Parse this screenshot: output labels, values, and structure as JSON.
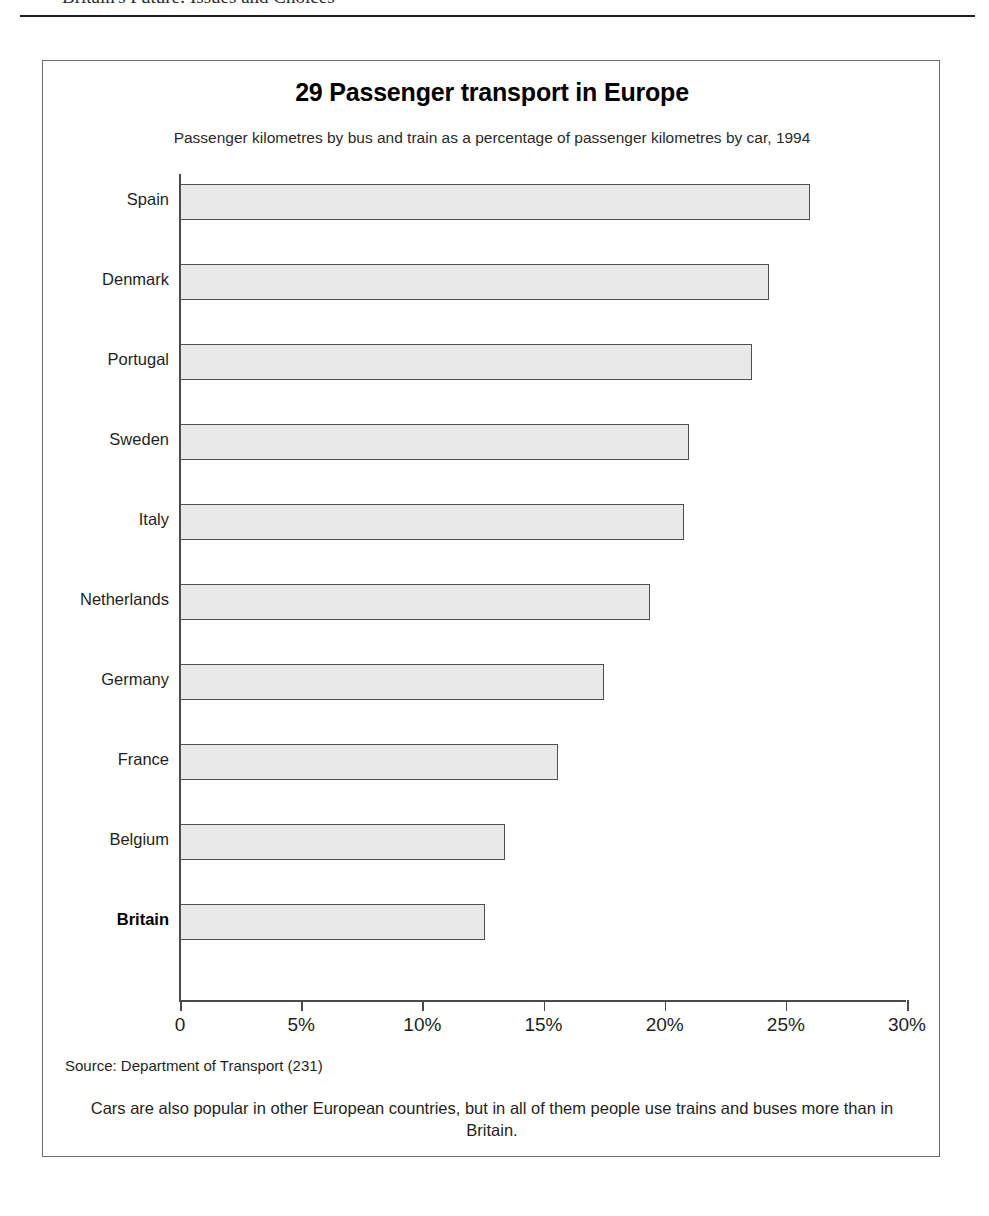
{
  "running_head": {
    "text": "Britain's Future: Issues and Choices"
  },
  "figure": {
    "title": "29 Passenger transport in Europe",
    "subtitle": "Passenger kilometres by bus and train as a percentage of passenger kilometres by car, 1994",
    "source": "Source: Department of Transport (231)",
    "caption": "Cars are also popular in other European countries, but in all of them people use trains and buses more than in Britain."
  },
  "chart_data": {
    "type": "bar",
    "orientation": "horizontal",
    "title": "29 Passenger transport in Europe",
    "subtitle": "Passenger kilometres by bus and train as a percentage of passenger kilometres by car, 1994",
    "xlabel": "",
    "ylabel": "",
    "xlim": [
      0,
      30
    ],
    "grid": false,
    "legend": null,
    "tick_labels": [
      "0",
      "5%",
      "10%",
      "15%",
      "20%",
      "25%",
      "30%"
    ],
    "ticks": [
      0,
      5,
      10,
      15,
      20,
      25,
      30
    ],
    "categories": [
      "Spain",
      "Denmark",
      "Portugal",
      "Sweden",
      "Italy",
      "Netherlands",
      "Germany",
      "France",
      "Belgium",
      "Britain"
    ],
    "values": [
      26.0,
      24.3,
      23.6,
      21.0,
      20.8,
      19.4,
      17.5,
      15.6,
      13.4,
      12.6
    ],
    "highlight": "Britain",
    "bar_fill": "#e9e9e9",
    "bar_stroke": "#4f4f4f",
    "bars": [
      {
        "label": "Spain",
        "value": 26.0,
        "bold": false
      },
      {
        "label": "Denmark",
        "value": 24.3,
        "bold": false
      },
      {
        "label": "Portugal",
        "value": 23.6,
        "bold": false
      },
      {
        "label": "Sweden",
        "value": 21.0,
        "bold": false
      },
      {
        "label": "Italy",
        "value": 20.8,
        "bold": false
      },
      {
        "label": "Netherlands",
        "value": 19.4,
        "bold": false
      },
      {
        "label": "Germany",
        "value": 17.5,
        "bold": false
      },
      {
        "label": "France",
        "value": 15.6,
        "bold": false
      },
      {
        "label": "Belgium",
        "value": 13.4,
        "bold": false
      },
      {
        "label": "Britain",
        "value": 12.6,
        "bold": true
      }
    ]
  }
}
